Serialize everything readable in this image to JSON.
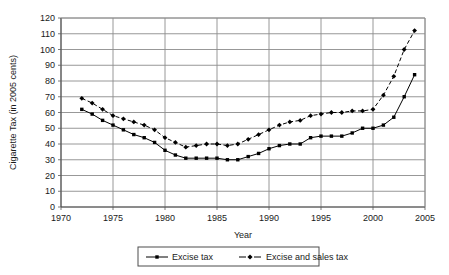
{
  "chart_data": {
    "type": "line",
    "title": "",
    "xlabel": "Year",
    "ylabel": "Cigarette Tax  (in 2005 cents)",
    "xlim": [
      1970,
      2005
    ],
    "ylim": [
      0,
      120
    ],
    "ytick_step": 10,
    "xtick_step": 5,
    "xticks": [
      "1970",
      "1975",
      "1980",
      "1985",
      "1990",
      "1995",
      "2000",
      "2005"
    ],
    "yticks": [
      "0",
      "10",
      "20",
      "30",
      "40",
      "50",
      "60",
      "70",
      "80",
      "90",
      "100",
      "110",
      "120"
    ],
    "grid": true,
    "legend_position": "bottom",
    "x": [
      1972,
      1973,
      1974,
      1975,
      1976,
      1977,
      1978,
      1979,
      1980,
      1981,
      1982,
      1983,
      1984,
      1985,
      1986,
      1987,
      1988,
      1989,
      1990,
      1991,
      1992,
      1993,
      1994,
      1995,
      1996,
      1997,
      1998,
      1999,
      2000,
      2001,
      2002,
      2003,
      2004
    ],
    "series": [
      {
        "name": "Excise tax",
        "marker": "square",
        "linestyle": "solid",
        "color": "#000000",
        "values": [
          62,
          59,
          55,
          52,
          49,
          46,
          44,
          41,
          36,
          33,
          31,
          31,
          31,
          31,
          30,
          30,
          32,
          34,
          37,
          39,
          40,
          40,
          44,
          45,
          45,
          45,
          47,
          50,
          50,
          52,
          57,
          70,
          84
        ]
      },
      {
        "name": "Excise and sales tax",
        "marker": "diamond",
        "linestyle": "dashed",
        "color": "#000000",
        "values": [
          69,
          66,
          62,
          58,
          56,
          54,
          52,
          49,
          44,
          41,
          38,
          39,
          40,
          40,
          39,
          40,
          43,
          46,
          49,
          52,
          54,
          55,
          58,
          59,
          60,
          60,
          61,
          61,
          62,
          71,
          83,
          100,
          112
        ]
      }
    ]
  },
  "legend": {
    "items": [
      {
        "label": "Excise tax",
        "marker": "square",
        "linestyle": "solid"
      },
      {
        "label": "Excise and sales tax",
        "marker": "diamond",
        "linestyle": "dashed"
      }
    ]
  }
}
